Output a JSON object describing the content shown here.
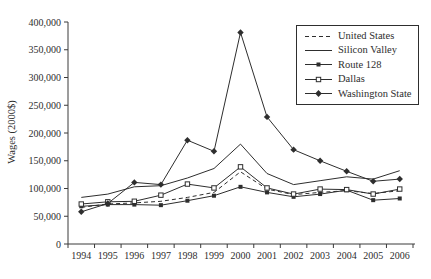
{
  "chart_data": {
    "type": "line",
    "title": "",
    "xlabel": "",
    "ylabel": "Wages (2000$)",
    "ylim": [
      0,
      400000
    ],
    "ytick_step": 50000,
    "ytick_labels": [
      "0",
      "50,000",
      "100,000",
      "150,000",
      "200,000",
      "250,000",
      "300,000",
      "350,000",
      "400,000"
    ],
    "categories": [
      "1994",
      "1995",
      "1996",
      "1997",
      "1998",
      "1999",
      "2000",
      "2001",
      "2002",
      "2003",
      "2004",
      "2005",
      "2006"
    ],
    "grid": false,
    "legend_position": "top-right",
    "line_color": "#2e2e2e",
    "axis_color": "#3a3a3a",
    "series": [
      {
        "name": "United States",
        "style": "dashed",
        "marker": "none",
        "values": [
          66000,
          72000,
          74000,
          77000,
          84000,
          93000,
          130000,
          99000,
          89000,
          93000,
          96000,
          91000,
          96000
        ]
      },
      {
        "name": "Silicon Valley",
        "style": "solid",
        "marker": "none",
        "values": [
          84000,
          90000,
          103000,
          105000,
          119000,
          136000,
          180000,
          127000,
          107000,
          114000,
          121000,
          117000,
          132000
        ]
      },
      {
        "name": "Route 128",
        "style": "solid",
        "marker": "filled-square",
        "values": [
          68000,
          71000,
          71000,
          70000,
          78000,
          87000,
          103000,
          93000,
          85000,
          90000,
          97000,
          79000,
          82000
        ]
      },
      {
        "name": "Dallas",
        "style": "solid",
        "marker": "open-square",
        "values": [
          72000,
          76000,
          77000,
          88000,
          108000,
          101000,
          139000,
          101000,
          90000,
          99000,
          98000,
          90000,
          99000
        ]
      },
      {
        "name": "Washington State",
        "style": "solid",
        "marker": "filled-diamond",
        "values": [
          58000,
          73000,
          111000,
          107000,
          187000,
          167000,
          381000,
          229000,
          170000,
          150000,
          131000,
          113000,
          117000
        ]
      }
    ]
  }
}
